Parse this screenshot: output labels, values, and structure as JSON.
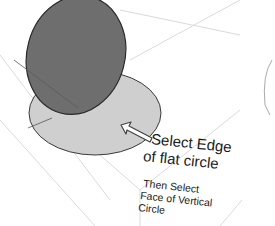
{
  "annotation": {
    "primary_line1": "Select Edge",
    "primary_line2": "of flat circle",
    "secondary_line1": "Then Select",
    "secondary_line2": "Face of Vertical",
    "secondary_line3": "Circle"
  },
  "colors": {
    "vertical_circle_fill": "#6e6e6e",
    "flat_circle_fill": "#cfcfcf",
    "outline": "#333333",
    "guide_lines": "#d8d8d8",
    "background": "#ffffff"
  }
}
